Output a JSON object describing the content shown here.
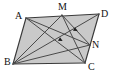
{
  "figure": {
    "shape_type": "parallelogram",
    "background_color": "#ffffff",
    "fill_color": "#c9c9c9",
    "line_color": "#3a3a3a",
    "label_color": "#111111",
    "vertices": [
      {
        "id": "A",
        "label": "A",
        "x": 26,
        "y": 18,
        "label_x": 15,
        "label_y": 11,
        "role": "parallelogram-vertex"
      },
      {
        "id": "M",
        "label": "M",
        "x": 62,
        "y": 15,
        "label_x": 58,
        "label_y": 2,
        "role": "point-on-segment-AD"
      },
      {
        "id": "D",
        "label": "D",
        "x": 99,
        "y": 14,
        "label_x": 101,
        "label_y": 9,
        "role": "parallelogram-vertex"
      },
      {
        "id": "N",
        "label": "N",
        "x": 90,
        "y": 45,
        "label_x": 92,
        "label_y": 40,
        "role": "point-on-segment-DC"
      },
      {
        "id": "C",
        "label": "C",
        "x": 85,
        "y": 63,
        "label_x": 88,
        "label_y": 62,
        "role": "parallelogram-vertex"
      },
      {
        "id": "B",
        "label": "B",
        "x": 13,
        "y": 64,
        "label_x": 4,
        "label_y": 57,
        "role": "parallelogram-vertex"
      }
    ],
    "outline_edges": [
      {
        "from": "A",
        "to": "D",
        "name": "edge-AD"
      },
      {
        "from": "D",
        "to": "C",
        "name": "edge-DC"
      },
      {
        "from": "C",
        "to": "B",
        "name": "edge-CB"
      },
      {
        "from": "B",
        "to": "A",
        "name": "edge-BA"
      }
    ],
    "inner_segments": [
      {
        "from": "A",
        "to": "C",
        "name": "diagonal-AC"
      },
      {
        "from": "B",
        "to": "D",
        "name": "diagonal-BD"
      },
      {
        "from": "B",
        "to": "M",
        "name": "segment-BM"
      },
      {
        "from": "B",
        "to": "N",
        "name": "segment-BN"
      },
      {
        "from": "M",
        "to": "C",
        "name": "segment-MC"
      },
      {
        "from": "M",
        "to": "N",
        "name": "segment-MN"
      },
      {
        "from": "A",
        "to": "N",
        "name": "segment-AN"
      }
    ],
    "arrow_markers": [
      {
        "name": "arrowhead-on-MC",
        "x": 59,
        "y": 39,
        "angle": 30
      },
      {
        "name": "arrowhead-on-MN",
        "x": 74,
        "y": 29,
        "angle": 28
      }
    ]
  }
}
